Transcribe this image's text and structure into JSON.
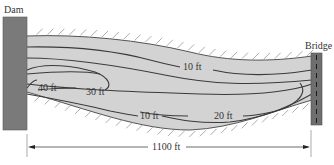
{
  "labels": {
    "dam": "Dam",
    "bridge": "Bridge",
    "distance": "1100 ft"
  },
  "contours": [
    {
      "depth": "40 ft"
    },
    {
      "depth": "30 ft"
    },
    {
      "depth": "20 ft"
    },
    {
      "depth": "10 ft"
    },
    {
      "depth": "10 ft"
    }
  ],
  "colors": {
    "water": "#d3d3d3",
    "dam": "#7a7a7a",
    "bridge": "#6e6e6e",
    "line": "#3a3a3a"
  }
}
